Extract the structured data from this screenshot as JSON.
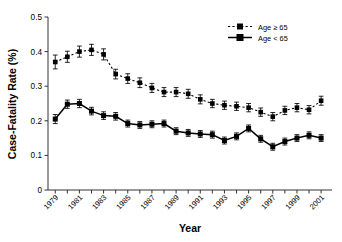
{
  "chart_data": {
    "type": "line",
    "title": "",
    "xlabel": "Year",
    "ylabel": "Case-Fatality Rate (%)",
    "xlim": [
      1978.4,
      2001.9
    ],
    "ylim": [
      0,
      0.5
    ],
    "grid": false,
    "legend_position": "top-right",
    "x": [
      1979,
      1980,
      1981,
      1982,
      1983,
      1984,
      1985,
      1986,
      1987,
      1988,
      1989,
      1990,
      1991,
      1992,
      1993,
      1994,
      1995,
      1996,
      1997,
      1998,
      1999,
      2000,
      2001
    ],
    "xticks": [
      1979,
      1981,
      1983,
      1985,
      1987,
      1989,
      1991,
      1993,
      1995,
      1997,
      1999,
      2001
    ],
    "xtick_labels": [
      "1979",
      "1981",
      "1983",
      "1985",
      "1987",
      "1989",
      "1991",
      "1993",
      "1995",
      "1997",
      "1999",
      "2001"
    ],
    "yticks": [
      0,
      0.1,
      0.2,
      0.3,
      0.4,
      0.5
    ],
    "ytick_labels": [
      "0",
      "0.1",
      "0.2",
      "0.3",
      "0.4",
      "0.5"
    ],
    "series": [
      {
        "name": "Age ≥ 65",
        "style": "dashed",
        "marker": "square",
        "values": [
          0.37,
          0.385,
          0.4,
          0.405,
          0.392,
          0.335,
          0.322,
          0.31,
          0.295,
          0.283,
          0.283,
          0.278,
          0.262,
          0.25,
          0.245,
          0.242,
          0.238,
          0.225,
          0.212,
          0.23,
          0.238,
          0.232,
          0.258
        ],
        "err": [
          0.02,
          0.016,
          0.016,
          0.016,
          0.016,
          0.014,
          0.014,
          0.014,
          0.013,
          0.013,
          0.013,
          0.013,
          0.013,
          0.012,
          0.012,
          0.012,
          0.012,
          0.012,
          0.012,
          0.012,
          0.012,
          0.012,
          0.013
        ]
      },
      {
        "name": "Age < 65",
        "style": "solid",
        "marker": "square",
        "values": [
          0.205,
          0.248,
          0.25,
          0.228,
          0.215,
          0.213,
          0.192,
          0.188,
          0.19,
          0.192,
          0.17,
          0.165,
          0.162,
          0.16,
          0.143,
          0.155,
          0.178,
          0.148,
          0.125,
          0.14,
          0.15,
          0.158,
          0.15
        ],
        "err": [
          0.013,
          0.012,
          0.012,
          0.011,
          0.011,
          0.011,
          0.01,
          0.01,
          0.01,
          0.01,
          0.01,
          0.01,
          0.01,
          0.01,
          0.01,
          0.01,
          0.01,
          0.01,
          0.01,
          0.01,
          0.01,
          0.01,
          0.01
        ]
      }
    ]
  },
  "legend": {
    "items": [
      {
        "label": "Age ≥ 65"
      },
      {
        "label": "Age < 65"
      }
    ]
  }
}
